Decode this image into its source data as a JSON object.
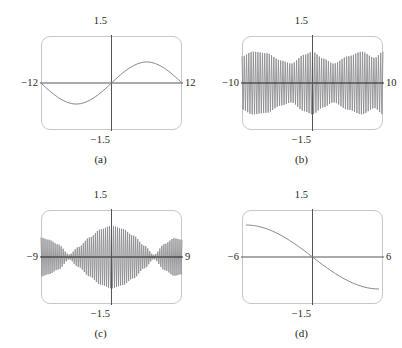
{
  "figure": {
    "background": "#ffffff",
    "curve_color": "#8a8a8e",
    "axis_color": "#56535a",
    "box_color": "#c9c6ca",
    "text_color": "#231f20"
  },
  "panels": [
    {
      "id": "a",
      "caption": "(a)",
      "labels": {
        "top": "1.5",
        "bottom": "−1.5",
        "left": "−12",
        "right": "12"
      },
      "chart_data": {
        "type": "line",
        "title": "(a)",
        "xlabel": "",
        "ylabel": "",
        "xlim": [
          -12,
          12
        ],
        "ylim": [
          -1.5,
          1.5
        ],
        "xticklabels": [
          "−12",
          "12"
        ],
        "yticklabels": [
          "−1.5",
          "1.5"
        ],
        "grid": false,
        "legend": "none",
        "description": "Smooth low-frequency sine-like wave: one full cycle across the window, negative trough on the left half, positive crest on the right half, crossing zero at the center.",
        "expression": "y = sin(x) sampled so one period fills the window",
        "series": [
          {
            "name": "curve-a",
            "x": [
              -12,
              -11,
              -10,
              -9,
              -8,
              -7,
              -6,
              -5,
              -4,
              -3,
              -2,
              -1,
              0,
              1,
              2,
              3,
              4,
              5,
              6,
              7,
              8,
              9,
              10,
              11,
              12
            ],
            "y": [
              0.0,
              -0.26,
              -0.5,
              -0.71,
              -0.87,
              -0.97,
              -1.0,
              -0.97,
              -0.87,
              -0.71,
              -0.5,
              -0.26,
              0.0,
              0.26,
              0.5,
              0.71,
              0.87,
              0.97,
              1.0,
              0.97,
              0.87,
              0.71,
              0.5,
              0.26,
              0.0
            ]
          }
        ]
      }
    },
    {
      "id": "b",
      "caption": "(b)",
      "labels": {
        "top": "1.5",
        "bottom": "−1.5",
        "left": "−10",
        "right": "10"
      },
      "chart_data": {
        "type": "line",
        "title": "(b)",
        "xlabel": "",
        "ylabel": "",
        "xlim": [
          -10,
          10
        ],
        "ylim": [
          -1.5,
          1.5
        ],
        "xticklabels": [
          "−10",
          "10"
        ],
        "yticklabels": [
          "−1.5",
          "1.5"
        ],
        "grid": false,
        "legend": "none",
        "description": "Aliased high-frequency sine: dense vertical oscillations filling the window with an irregular amplitude envelope that dips near the quarter points and at the center, peaking near the edges.",
        "expression": "y = sin(k x) with k large (aliasing artifact)",
        "envelope_nodes": [
          {
            "x": -10,
            "amplitude": 0.85
          },
          {
            "x": -8.5,
            "amplitude": 1.0
          },
          {
            "x": -6.5,
            "amplitude": 0.95
          },
          {
            "x": -4.5,
            "amplitude": 0.72
          },
          {
            "x": -3.0,
            "amplitude": 0.62
          },
          {
            "x": -1.2,
            "amplitude": 0.9
          },
          {
            "x": 0.0,
            "amplitude": 1.0
          },
          {
            "x": 1.5,
            "amplitude": 0.78
          },
          {
            "x": 3.0,
            "amplitude": 0.62
          },
          {
            "x": 5.0,
            "amplitude": 0.85
          },
          {
            "x": 7.0,
            "amplitude": 1.0
          },
          {
            "x": 8.8,
            "amplitude": 0.8
          },
          {
            "x": 10,
            "amplitude": 1.0
          }
        ],
        "oscillation_count": 62
      }
    },
    {
      "id": "c",
      "caption": "(c)",
      "labels": {
        "top": "1.5",
        "bottom": "−1.5",
        "left": "−9",
        "right": "9"
      },
      "chart_data": {
        "type": "line",
        "title": "(c)",
        "xlabel": "",
        "ylabel": "",
        "xlim": [
          -9,
          9
        ],
        "ylim": [
          -1.5,
          1.5
        ],
        "xticklabels": [
          "−9",
          "9"
        ],
        "yticklabels": [
          "−1.5",
          "1.5"
        ],
        "grid": false,
        "legend": "none",
        "description": "Beat pattern: dense oscillations whose amplitude envelope forms a large central lobe peaking at x=0, with nodes near x=±5 and smaller side lobes near the window edges.",
        "expression": "y = sin(k x) producing a beat envelope |cos(πx/10)| style modulation",
        "envelope_nodes": [
          {
            "x": -9,
            "amplitude": 0.62
          },
          {
            "x": -8.0,
            "amplitude": 0.55
          },
          {
            "x": -6.8,
            "amplitude": 0.4
          },
          {
            "x": -5.4,
            "amplitude": 0.08
          },
          {
            "x": -4.2,
            "amplitude": 0.32
          },
          {
            "x": -2.8,
            "amplitude": 0.62
          },
          {
            "x": -1.4,
            "amplitude": 0.88
          },
          {
            "x": 0.0,
            "amplitude": 1.0
          },
          {
            "x": 1.4,
            "amplitude": 0.9
          },
          {
            "x": 2.8,
            "amplitude": 0.68
          },
          {
            "x": 4.2,
            "amplitude": 0.36
          },
          {
            "x": 5.4,
            "amplitude": 0.07
          },
          {
            "x": 6.8,
            "amplitude": 0.42
          },
          {
            "x": 8.0,
            "amplitude": 0.6
          },
          {
            "x": 9,
            "amplitude": 0.55
          }
        ],
        "oscillation_count": 70
      }
    },
    {
      "id": "d",
      "caption": "(d)",
      "labels": {
        "top": "1.5",
        "bottom": "−1.5",
        "left": "−6",
        "right": "6"
      },
      "chart_data": {
        "type": "line",
        "title": "(d)",
        "xlabel": "",
        "ylabel": "",
        "xlim": [
          -6,
          6
        ],
        "ylim": [
          -1.5,
          1.5
        ],
        "xticklabels": [
          "−6",
          "6"
        ],
        "yticklabels": [
          "−1.5",
          "1.5"
        ],
        "grid": false,
        "legend": "none",
        "description": "Smooth monotone decreasing S-shaped curve: starts high on the left near y=1, falls through the origin, and flattens low on the right near y=−1.",
        "expression": "y = −sin(πx/12) style half-period decreasing curve",
        "series": [
          {
            "name": "curve-d",
            "x": [
              -6,
              -5,
              -4,
              -3,
              -2,
              -1,
              0,
              1,
              2,
              3,
              4,
              5,
              6
            ],
            "y": [
              1.0,
              0.97,
              0.87,
              0.71,
              0.5,
              0.26,
              0.0,
              -0.26,
              -0.5,
              -0.71,
              -0.87,
              -0.97,
              -1.0
            ]
          }
        ]
      }
    }
  ]
}
